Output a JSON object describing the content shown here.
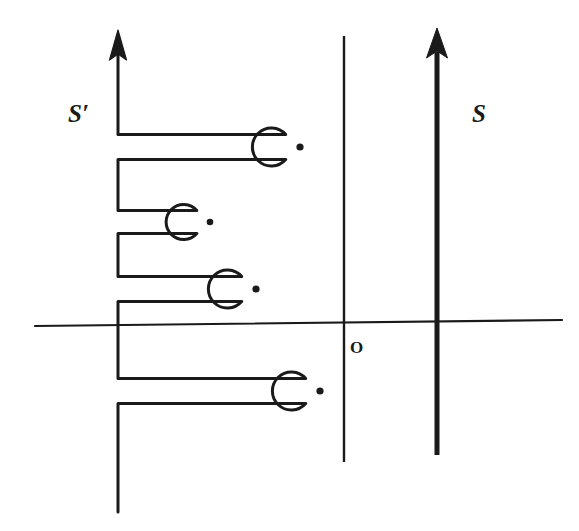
{
  "figure": {
    "title": "",
    "background_color": "#ffffff",
    "ink_color": "#1a1a1a",
    "labels": {
      "s_prime": "S′",
      "s": "S",
      "origin": "O"
    }
  },
  "chart_data": {
    "type": "diagram",
    "axes": {
      "real_axis": {
        "name": "real-axis",
        "x1": 35,
        "y1": 326,
        "x2": 562,
        "y2": 320,
        "stroke_width": 2.2,
        "arrow": false
      },
      "vertical_line_left": {
        "name": "left-vertical-line",
        "x": 344,
        "y1": 36,
        "y2": 462,
        "stroke_width": 2.4,
        "arrow": false
      },
      "s_axis": {
        "name": "s-contour",
        "x": 437,
        "y_top": 32,
        "y_bottom": 455,
        "stroke_width": 5.0,
        "arrow": true,
        "arrow_direction": "up"
      },
      "s_prime_axis": {
        "name": "s-prime-arrow",
        "x": 118,
        "y_top": 34,
        "y_bottom": 133,
        "stroke_width": 3.2,
        "arrow": true,
        "arrow_direction": "up"
      }
    },
    "label_positions": {
      "s_prime": {
        "x": 68,
        "y": 122,
        "font_size": 25
      },
      "s": {
        "x": 472,
        "y": 122,
        "font_size": 25
      },
      "origin": {
        "x": 350,
        "y": 353,
        "font_size": 17
      }
    },
    "keyholes": [
      {
        "index": 1,
        "name": "keyhole-1",
        "center_x": 300,
        "center_y": 147,
        "radius": 19,
        "dot_radius": 3.6,
        "slot_half_height": 12.5,
        "left_x": 118
      },
      {
        "index": 2,
        "name": "keyhole-2",
        "center_x": 210,
        "center_y": 222,
        "radius": 17.5,
        "dot_radius": 3.3,
        "slot_half_height": 11.5,
        "left_x": 118
      },
      {
        "index": 3,
        "name": "keyhole-3",
        "center_x": 256,
        "center_y": 289,
        "radius": 19,
        "dot_radius": 3.6,
        "slot_half_height": 12.5,
        "left_x": 118
      },
      {
        "index": 4,
        "name": "keyhole-4",
        "center_x": 320,
        "center_y": 391,
        "radius": 19,
        "dot_radius": 3.6,
        "slot_half_height": 12.5,
        "left_x": 118
      }
    ],
    "contour_path_points": "starts at (118,34) top arrow, down to (118,135), right to keyhole 1 upper, around circle 1, back left to (118,160), down to (118,210), right to keyhole 2 upper, around circle 2, back left to (118,234), down to (118,277), right to keyhole 3 upper, around circle 3, back left to (118,301), down to (118,379), right to keyhole 4 upper, around circle 4, back left to (118,403), down to (118,512)",
    "stroke_width_contour": 3.0,
    "branch_point_count": 4
  }
}
